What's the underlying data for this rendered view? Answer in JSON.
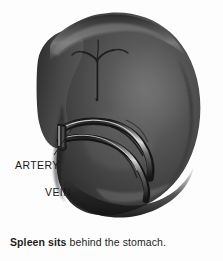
{
  "figure": {
    "background_color": "#fdfdfd",
    "labels": [
      {
        "id": "artery",
        "text": "ARTERY"
      },
      {
        "id": "vein",
        "text": "VEIN"
      }
    ],
    "caption": {
      "bold_part": "Spleen sits",
      "rest_part": " behind the stomach."
    },
    "colors": {
      "organ_dark": "#2f2f2f",
      "organ_mid": "#4a4a4a",
      "organ_light": "#6e6e6e",
      "organ_shadow": "#1c1c1c",
      "vessel_highlight": "#e8e8e8",
      "leader_line": "#222222",
      "text": "#1a1a1a"
    }
  }
}
